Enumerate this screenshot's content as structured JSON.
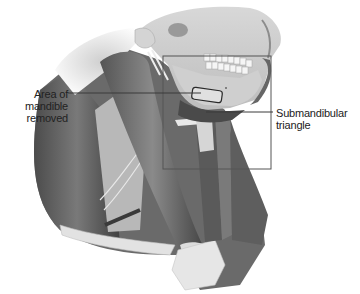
{
  "figure": {
    "labels": {
      "mandible": {
        "lines": [
          "Area of",
          "mandible",
          "removed"
        ]
      },
      "submandibular": {
        "lines": [
          "Submandibular",
          "triangle"
        ]
      }
    },
    "colors": {
      "background": "#ffffff",
      "leader_line": "#3a3a3a",
      "box_outline": "#555555",
      "label_text": "#222222"
    }
  }
}
